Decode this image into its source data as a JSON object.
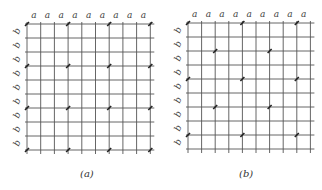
{
  "figure": {
    "panels": [
      {
        "id": "a",
        "caption": "(a)",
        "grid": {
          "x0": 27,
          "y0": 24,
          "dx": 13.7,
          "dy": 14,
          "cols": 9,
          "rows": 9
        },
        "col_label": "a",
        "row_label": "b",
        "points": [
          [
            0,
            0
          ],
          [
            3,
            0
          ],
          [
            6,
            0
          ],
          [
            9,
            0
          ],
          [
            0,
            3
          ],
          [
            3,
            3
          ],
          [
            6,
            3
          ],
          [
            9,
            3
          ],
          [
            0,
            6
          ],
          [
            3,
            6
          ],
          [
            6,
            6
          ],
          [
            9,
            6
          ],
          [
            0,
            9
          ],
          [
            3,
            9
          ],
          [
            6,
            9
          ],
          [
            9,
            9
          ]
        ],
        "caption_pos": {
          "x": 80,
          "y": 175
        }
      },
      {
        "id": "b",
        "caption": "(b)",
        "grid": {
          "x0": 188,
          "y0": 23,
          "dx": 13.6,
          "dy": 14,
          "cols": 9,
          "rows": 9
        },
        "col_label": "a",
        "row_label": "b",
        "points": [
          [
            0,
            0
          ],
          [
            4,
            0
          ],
          [
            8,
            0
          ],
          [
            2,
            2
          ],
          [
            6,
            2
          ],
          [
            0,
            4
          ],
          [
            4,
            4
          ],
          [
            8,
            4
          ],
          [
            2,
            6
          ],
          [
            6,
            6
          ],
          [
            0,
            8
          ],
          [
            4,
            8
          ],
          [
            8,
            8
          ]
        ],
        "caption_pos": {
          "x": 239,
          "y": 175
        }
      }
    ],
    "colors": {
      "line": "#555555",
      "point": "#222222",
      "label": "#444444"
    }
  }
}
